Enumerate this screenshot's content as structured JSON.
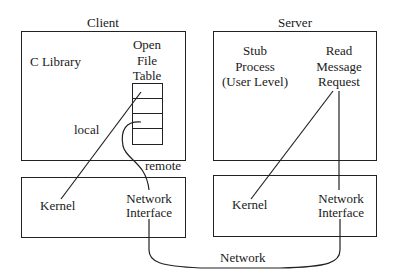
{
  "diagram": {
    "client": {
      "title": "Client",
      "c_library": "C Library",
      "open_file_table": [
        "Open",
        "File",
        "Table"
      ],
      "file_table_rows": 4,
      "local_label": "local",
      "remote_label": "remote",
      "kernel": "Kernel",
      "network_interface": [
        "Network",
        "Interface"
      ]
    },
    "server": {
      "title": "Server",
      "stub_process": [
        "Stub",
        "Process",
        "(User Level)"
      ],
      "read_message_request": [
        "Read",
        "Message",
        "Request"
      ],
      "kernel": "Kernel",
      "network_interface": [
        "Network",
        "Interface"
      ]
    },
    "network_label": "Network",
    "colors": {
      "ink": "#222222",
      "background": "#ffffff"
    }
  }
}
